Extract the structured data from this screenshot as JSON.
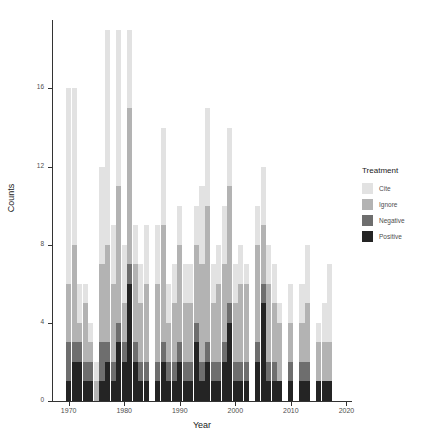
{
  "chart_data": {
    "type": "bar",
    "stacked": true,
    "title": "",
    "xlabel": "Year",
    "ylabel": "Counts",
    "xlim": [
      1967,
      2021
    ],
    "ylim": [
      0,
      19.5
    ],
    "xticks": [
      1970,
      1980,
      1990,
      2000,
      2010,
      2020
    ],
    "yticks": [
      0,
      4,
      8,
      12,
      16
    ],
    "grid": false,
    "legend": {
      "title": "Treatment",
      "position": "right",
      "entries": [
        "Cite",
        "Ignore",
        "Negative",
        "Positive"
      ]
    },
    "colors": {
      "Cite": "#e2e2e2",
      "Ignore": "#b3b3b3",
      "Negative": "#6e6e6e",
      "Positive": "#242424"
    },
    "series": [
      {
        "name": "Positive",
        "values": [
          0,
          0,
          1,
          2,
          2,
          1,
          1,
          0,
          1,
          2,
          1,
          3,
          2,
          6,
          2,
          1,
          1,
          0,
          1,
          2,
          1,
          1,
          2,
          1,
          1,
          3,
          1,
          2,
          1,
          1,
          2,
          4,
          1,
          1,
          1,
          0,
          2,
          5,
          1,
          1,
          1,
          0,
          1,
          0,
          1,
          1,
          0,
          1,
          1,
          1,
          0,
          0
        ]
      },
      {
        "name": "Negative",
        "values": [
          0,
          0,
          2,
          1,
          1,
          1,
          1,
          0,
          2,
          1,
          1,
          1,
          1,
          1,
          1,
          1,
          1,
          0,
          1,
          1,
          1,
          1,
          1,
          1,
          1,
          1,
          1,
          1,
          1,
          1,
          1,
          1,
          1,
          1,
          1,
          0,
          1,
          1,
          1,
          1,
          0,
          0,
          1,
          0,
          1,
          1,
          0,
          0,
          0,
          0,
          0,
          0
        ]
      },
      {
        "name": "Ignore",
        "values": [
          0,
          0,
          3,
          5,
          1,
          3,
          1,
          1,
          4,
          5,
          4,
          7,
          2,
          8,
          4,
          3,
          4,
          0,
          4,
          6,
          2,
          3,
          5,
          3,
          3,
          4,
          5,
          7,
          3,
          4,
          4,
          6,
          3,
          4,
          4,
          0,
          5,
          3,
          4,
          3,
          3,
          0,
          2,
          0,
          2,
          3,
          0,
          2,
          2,
          2,
          0,
          0
        ]
      },
      {
        "name": "Cite",
        "values": [
          0,
          0,
          10,
          8,
          2,
          1,
          1,
          1,
          5,
          11,
          3,
          8,
          3,
          4,
          2,
          2,
          3,
          0,
          3,
          5,
          2,
          2,
          2,
          2,
          2,
          2,
          4,
          5,
          2,
          2,
          3,
          3,
          2,
          2,
          1,
          0,
          2,
          3,
          2,
          2,
          1,
          0,
          2,
          0,
          2,
          3,
          0,
          1,
          2,
          4,
          0,
          0
        ]
      }
    ],
    "x": [
      1968,
      1969,
      1970,
      1971,
      1972,
      1973,
      1974,
      1975,
      1976,
      1977,
      1978,
      1979,
      1980,
      1981,
      1982,
      1983,
      1984,
      1985,
      1986,
      1987,
      1988,
      1989,
      1990,
      1991,
      1992,
      1993,
      1994,
      1995,
      1996,
      1997,
      1998,
      1999,
      2000,
      2001,
      2002,
      2003,
      2004,
      2005,
      2006,
      2007,
      2008,
      2009,
      2010,
      2011,
      2012,
      2013,
      2014,
      2015,
      2016,
      2017,
      2018,
      2019
    ]
  }
}
